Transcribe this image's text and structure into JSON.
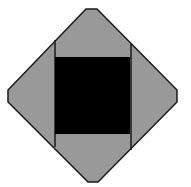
{
  "diagram": {
    "colors": {
      "background": "#ffffff",
      "diamond_fill": "#999999",
      "outline": "#1a1a1a",
      "square_fill": "#000000"
    },
    "shapes": {
      "diamond_points": "86,9 97,9 177,90 177,102 98,182 88,182 8,102 8,90",
      "square": {
        "x": 55,
        "y": 57,
        "width": 75,
        "height": 77
      },
      "left_line": {
        "x": 55,
        "y1": 40,
        "y2": 147
      },
      "right_line": {
        "x": 131,
        "y1": 44,
        "y2": 150
      }
    }
  }
}
